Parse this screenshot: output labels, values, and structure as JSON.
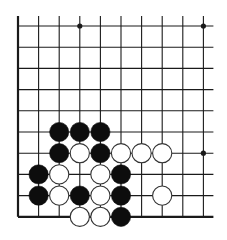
{
  "board": {
    "title": "Go board diagram (lower-left corner section)",
    "cols": 10,
    "rows": 10,
    "origin_x": 18,
    "origin_y": 26,
    "spacing_x": 20.6,
    "spacing_y": 21.2,
    "line_color": "#1a1a1a",
    "black_color": "#0d0d0d",
    "white_fill": "#ffffff",
    "white_stroke": "#333333",
    "edges": {
      "left": true,
      "bottom": true,
      "top": false,
      "right": false
    },
    "star_points": [
      {
        "col": 3,
        "row": 0
      },
      {
        "col": 9,
        "row": 0
      },
      {
        "col": 9,
        "row": 6
      }
    ],
    "stones": [
      {
        "color": "black",
        "col": 2,
        "row": 5
      },
      {
        "color": "black",
        "col": 3,
        "row": 5
      },
      {
        "color": "black",
        "col": 4,
        "row": 5
      },
      {
        "color": "black",
        "col": 2,
        "row": 6
      },
      {
        "color": "white",
        "col": 3,
        "row": 6
      },
      {
        "color": "black",
        "col": 4,
        "row": 6
      },
      {
        "color": "white",
        "col": 5,
        "row": 6
      },
      {
        "color": "white",
        "col": 6,
        "row": 6
      },
      {
        "color": "white",
        "col": 7,
        "row": 6
      },
      {
        "color": "black",
        "col": 1,
        "row": 7
      },
      {
        "color": "white",
        "col": 2,
        "row": 7
      },
      {
        "color": "white",
        "col": 4,
        "row": 7
      },
      {
        "color": "black",
        "col": 5,
        "row": 7
      },
      {
        "color": "black",
        "col": 1,
        "row": 8
      },
      {
        "color": "white",
        "col": 2,
        "row": 8
      },
      {
        "color": "black",
        "col": 3,
        "row": 8
      },
      {
        "color": "white",
        "col": 4,
        "row": 8
      },
      {
        "color": "black",
        "col": 5,
        "row": 8
      },
      {
        "color": "white",
        "col": 7,
        "row": 8
      },
      {
        "color": "white",
        "col": 3,
        "row": 9
      },
      {
        "color": "white",
        "col": 4,
        "row": 9
      },
      {
        "color": "black",
        "col": 5,
        "row": 9
      }
    ]
  }
}
